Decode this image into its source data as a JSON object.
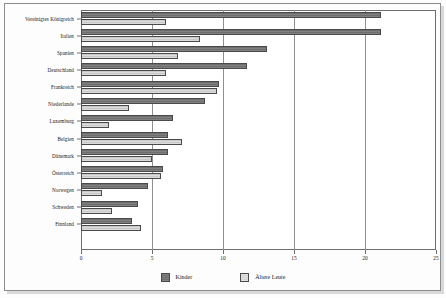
{
  "chart_data": {
    "type": "bar",
    "orientation": "horizontal",
    "title": "",
    "xlabel": "",
    "ylabel": "",
    "xlim": [
      0,
      25
    ],
    "xticks": [
      0,
      5,
      10,
      15,
      20,
      25
    ],
    "grid": true,
    "legend_position": "bottom-center",
    "categories": [
      "Vereinigtes Königreich",
      "Italien",
      "Spanien",
      "Deutschland",
      "Frankreich",
      "Niederlande",
      "Luxemburg",
      "Belgien",
      "Dänemark",
      "Österreich",
      "Norwegen",
      "Schweden",
      "Finnland"
    ],
    "series": [
      {
        "name": "Kinder",
        "color": "#6e6e6e",
        "values": [
          21.1,
          21.1,
          13.1,
          11.7,
          9.7,
          8.7,
          6.5,
          6.1,
          6.1,
          5.8,
          4.7,
          4.0,
          3.6
        ]
      },
      {
        "name": "Ältere Leute",
        "color": "#c9c9c9",
        "values": [
          6.0,
          8.4,
          6.8,
          6.0,
          9.6,
          3.4,
          2.0,
          7.1,
          5.0,
          5.6,
          1.5,
          2.2,
          4.2
        ]
      }
    ]
  },
  "legend": {
    "items": [
      {
        "label": "Kinder",
        "swatch": "kinder"
      },
      {
        "label": "Ältere Leute",
        "swatch": "aeltere"
      }
    ]
  }
}
